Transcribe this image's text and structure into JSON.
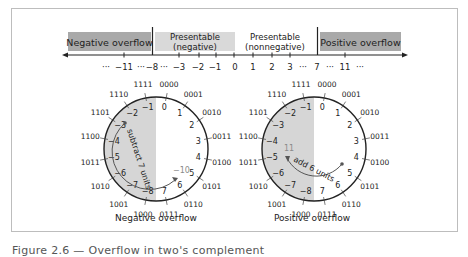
{
  "number_line": {
    "regions": {
      "negative_overflow": "Negative overflow",
      "presentable_negative_line1": "Presentable",
      "presentable_negative_line2": "(negative)",
      "presentable_nonnegative_line1": "Presentable",
      "presentable_nonnegative_line2": "(nonnegative)",
      "positive_overflow": "Positive overflow"
    },
    "tick_labels": {
      "dots_left": "···",
      "m11": "−11",
      "dots_a": "···",
      "m8": "−8",
      "dots_b": "···",
      "m3": "−3",
      "m2": "−2",
      "m1": "−1",
      "z0": "0",
      "p1": "1",
      "p2": "2",
      "p3": "3",
      "dots_c": "···",
      "p7": "7",
      "dots_d": "···",
      "p11": "11",
      "dots_right": "···"
    }
  },
  "wheel": {
    "binary": [
      "0000",
      "0001",
      "0010",
      "0011",
      "0100",
      "0101",
      "0110",
      "0111",
      "1000",
      "1001",
      "1010",
      "1011",
      "1100",
      "1101",
      "1110",
      "1111"
    ],
    "decimal": [
      "0",
      "1",
      "2",
      "3",
      "4",
      "5",
      "6",
      "7",
      "−8",
      "−7",
      "−6",
      "−5",
      "−4",
      "−3",
      "−2",
      "−1"
    ]
  },
  "left_diagram": {
    "arc_label": "subtract 7 units",
    "result_label": "−10",
    "caption": "Negative overflow"
  },
  "right_diagram": {
    "arc_label": "add 6 units",
    "result_label": "11",
    "caption": "Positive overflow"
  },
  "colors": {
    "overflow_fill": "#a9a9a9",
    "presentable_fill": "#d9d9d9",
    "negative_half_fill": "#d6d6d6",
    "line": "#222222",
    "muted_label": "#8a8a8a"
  },
  "figure_caption_partial": "Figure 2.6 — Overflow in two's complement"
}
